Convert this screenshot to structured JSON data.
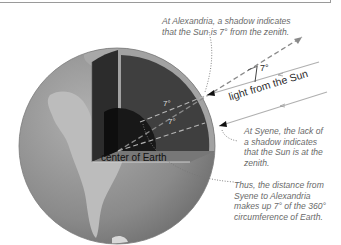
{
  "figure": {
    "caption_alexandria": [
      "At Alexandria, a shadow indicates",
      "that the Sun is 7° from the zenith."
    ],
    "caption_syene": [
      "At Syene, the lack of",
      "a shadow indicates",
      "that the Sun is at the",
      "zenith."
    ],
    "caption_conclusion": [
      "Thus, the distance from",
      "Syene to Alexandria",
      "makes up 7° of the 360°",
      "circumference of Earth."
    ],
    "label_light": "light from the Sun",
    "label_center": "center of Earth",
    "angle_outer": "7°",
    "angle_inner_1": "7°",
    "angle_inner_2": "7°"
  },
  "colors": {
    "globe_ocean": "#8e8e8e",
    "globe_land": "#b8b8b8",
    "crust": "#a6a6a6",
    "mantle": "#3e3e3e",
    "core": "#1a1a1a",
    "caption": "#6a6a6a"
  }
}
